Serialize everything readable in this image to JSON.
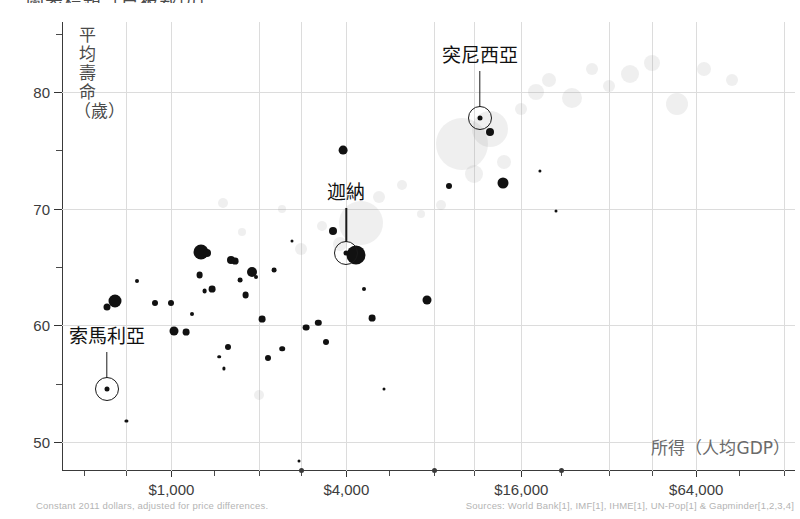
{
  "title_clipped": "圖表標題（已被裁切）",
  "footer": {
    "left": "Constant 2011 dollars, adjusted for price differences.",
    "right": "Sources: World Bank[1], IMF[1], IHME[1], UN-Pop[1] & Gapminder[1,2,3,4]"
  },
  "axes": {
    "y_title": "平均壽命（歲）",
    "x_title": "所得（人均GDP）"
  },
  "annotations": [
    {
      "label": "索馬利亞",
      "x": 600,
      "y": 54.5
    },
    {
      "label": "迦納",
      "x": 4000,
      "y": 66.2
    },
    {
      "label": "突尼西亞",
      "x": 11500,
      "y": 77.8
    }
  ],
  "chart_data": {
    "type": "scatter",
    "xlabel": "所得（人均GDP）",
    "ylabel": "平均壽命（歲）",
    "x_scale": "log",
    "xlim": [
      420,
      140000
    ],
    "ylim": [
      47.5,
      86
    ],
    "xticks": [
      1000,
      4000,
      16000,
      64000
    ],
    "xtick_labels": [
      "$1,000",
      "$4,000",
      "$16,000",
      "$64,000"
    ],
    "yticks": [
      50,
      60,
      70,
      80
    ],
    "ytick_labels": [
      "50",
      "60",
      "70",
      "80"
    ],
    "y_minor_ticks": [
      55,
      65,
      75,
      85
    ],
    "grid": true,
    "legend": null,
    "series": [
      {
        "name": "非洲（深色泡泡）",
        "color": "#111111",
        "points": [
          {
            "x": 640,
            "y": 62.1,
            "r": 6.5
          },
          {
            "x": 600,
            "y": 61.6,
            "r": 3.5
          },
          {
            "x": 760,
            "y": 63.8,
            "r": 2.0
          },
          {
            "x": 700,
            "y": 51.8,
            "r": 1.6
          },
          {
            "x": 880,
            "y": 61.9,
            "r": 3.0
          },
          {
            "x": 1000,
            "y": 61.9,
            "r": 3.0
          },
          {
            "x": 1020,
            "y": 59.5,
            "r": 4.5
          },
          {
            "x": 1120,
            "y": 59.4,
            "r": 3.4
          },
          {
            "x": 1180,
            "y": 61.0,
            "r": 2.0
          },
          {
            "x": 1250,
            "y": 64.3,
            "r": 3.4
          },
          {
            "x": 1260,
            "y": 66.3,
            "r": 7.5
          },
          {
            "x": 1330,
            "y": 66.2,
            "r": 4.0
          },
          {
            "x": 1300,
            "y": 62.9,
            "r": 2.4
          },
          {
            "x": 1380,
            "y": 63.1,
            "r": 3.4
          },
          {
            "x": 1460,
            "y": 57.3,
            "r": 1.8
          },
          {
            "x": 1520,
            "y": 56.3,
            "r": 1.6
          },
          {
            "x": 1560,
            "y": 58.1,
            "r": 3.0
          },
          {
            "x": 1600,
            "y": 65.6,
            "r": 4.0
          },
          {
            "x": 1660,
            "y": 65.5,
            "r": 3.4
          },
          {
            "x": 1720,
            "y": 63.9,
            "r": 2.4
          },
          {
            "x": 1800,
            "y": 62.6,
            "r": 3.4
          },
          {
            "x": 1900,
            "y": 64.6,
            "r": 5.0
          },
          {
            "x": 1960,
            "y": 64.1,
            "r": 2.0
          },
          {
            "x": 2050,
            "y": 60.5,
            "r": 3.4
          },
          {
            "x": 2150,
            "y": 57.2,
            "r": 3.0
          },
          {
            "x": 2250,
            "y": 64.7,
            "r": 2.4
          },
          {
            "x": 2400,
            "y": 58.0,
            "r": 2.8
          },
          {
            "x": 2600,
            "y": 67.2,
            "r": 1.5
          },
          {
            "x": 2750,
            "y": 48.4,
            "r": 1.5
          },
          {
            "x": 2900,
            "y": 59.8,
            "r": 3.4
          },
          {
            "x": 3200,
            "y": 60.2,
            "r": 3.2
          },
          {
            "x": 3400,
            "y": 58.6,
            "r": 3.0
          },
          {
            "x": 3600,
            "y": 68.1,
            "r": 4.0
          },
          {
            "x": 3900,
            "y": 75.0,
            "r": 4.4
          },
          {
            "x": 4300,
            "y": 66.0,
            "r": 9.5
          },
          {
            "x": 4600,
            "y": 63.1,
            "r": 2.0
          },
          {
            "x": 4900,
            "y": 60.6,
            "r": 3.4
          },
          {
            "x": 5400,
            "y": 54.5,
            "r": 1.5
          },
          {
            "x": 7600,
            "y": 62.2,
            "r": 4.5
          },
          {
            "x": 9000,
            "y": 71.9,
            "r": 3.0
          },
          {
            "x": 12500,
            "y": 76.6,
            "r": 4.0
          },
          {
            "x": 13800,
            "y": 72.2,
            "r": 5.5
          },
          {
            "x": 18500,
            "y": 73.2,
            "r": 1.6
          },
          {
            "x": 21000,
            "y": 69.8,
            "r": 1.5
          }
        ]
      },
      {
        "name": "其他地區（淺色泡泡）",
        "color": "#c9c9c9",
        "points": [
          {
            "x": 1500,
            "y": 70.5,
            "r": 5
          },
          {
            "x": 1750,
            "y": 68.0,
            "r": 4
          },
          {
            "x": 2000,
            "y": 54.0,
            "r": 5
          },
          {
            "x": 2400,
            "y": 70.0,
            "r": 4
          },
          {
            "x": 2800,
            "y": 66.5,
            "r": 6
          },
          {
            "x": 3300,
            "y": 68.5,
            "r": 5
          },
          {
            "x": 3800,
            "y": 67.0,
            "r": 7
          },
          {
            "x": 4500,
            "y": 68.8,
            "r": 22
          },
          {
            "x": 5200,
            "y": 71.0,
            "r": 6
          },
          {
            "x": 6200,
            "y": 72.0,
            "r": 5
          },
          {
            "x": 7200,
            "y": 69.5,
            "r": 4
          },
          {
            "x": 8500,
            "y": 70.3,
            "r": 5
          },
          {
            "x": 10000,
            "y": 75.5,
            "r": 26
          },
          {
            "x": 11000,
            "y": 73.0,
            "r": 9
          },
          {
            "x": 12500,
            "y": 76.8,
            "r": 18
          },
          {
            "x": 14000,
            "y": 74.0,
            "r": 7
          },
          {
            "x": 16000,
            "y": 78.5,
            "r": 6
          },
          {
            "x": 18000,
            "y": 80.0,
            "r": 8
          },
          {
            "x": 20000,
            "y": 81.0,
            "r": 7
          },
          {
            "x": 24000,
            "y": 79.5,
            "r": 10
          },
          {
            "x": 28000,
            "y": 82.0,
            "r": 6
          },
          {
            "x": 32000,
            "y": 80.5,
            "r": 6
          },
          {
            "x": 38000,
            "y": 81.5,
            "r": 9
          },
          {
            "x": 45000,
            "y": 82.5,
            "r": 8
          },
          {
            "x": 55000,
            "y": 79.0,
            "r": 11
          },
          {
            "x": 68000,
            "y": 82.0,
            "r": 7
          },
          {
            "x": 85000,
            "y": 81.0,
            "r": 6
          }
        ]
      }
    ]
  }
}
